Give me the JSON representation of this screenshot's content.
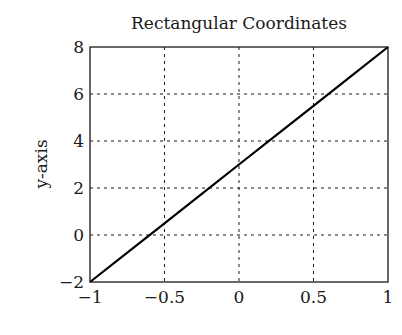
{
  "chart_data": {
    "type": "line",
    "title": "Rectangular Coordinates",
    "xlabel": "",
    "ylabel": "y-axis",
    "xlim": [
      -1,
      1
    ],
    "ylim": [
      -2,
      8
    ],
    "xticks": [
      -1,
      -0.5,
      0,
      0.5,
      1
    ],
    "xtick_labels": [
      "−1",
      "−0.5",
      "0",
      "0.5",
      "1"
    ],
    "yticks": [
      -2,
      0,
      2,
      4,
      6,
      8
    ],
    "ytick_labels": [
      "−2",
      "0",
      "2",
      "4",
      "6",
      "8"
    ],
    "grid": true,
    "grid_style": "dashed",
    "legend": null,
    "series": [
      {
        "name": "y = 5x + 3",
        "color": "#000000",
        "x": [
          -1,
          -0.75,
          -0.5,
          -0.25,
          0,
          0.25,
          0.5,
          0.75,
          1
        ],
        "y": [
          -2,
          -0.75,
          0.5,
          1.75,
          3,
          4.25,
          5.5,
          6.75,
          8
        ]
      }
    ]
  },
  "colors": {
    "axis": "#1a1a1a",
    "grid": "#1a1a1a",
    "line": "#000000",
    "background": "#ffffff"
  }
}
